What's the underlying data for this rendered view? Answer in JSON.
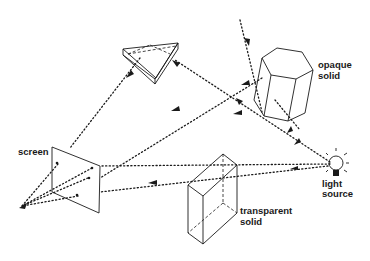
{
  "diagram": {
    "labels": {
      "screen": "screen",
      "opaque_line1": "opaque",
      "opaque_line2": "solid",
      "transparent_line1": "transparent",
      "transparent_line2": "solid",
      "light_line1": "light",
      "light_line2": "source"
    },
    "objects": [
      {
        "id": "light-source",
        "shape": "light bulb with rays"
      },
      {
        "id": "opaque-solid",
        "shape": "hexagonal prism"
      },
      {
        "id": "transparent-solid",
        "shape": "rectangular box (wireframe)"
      },
      {
        "id": "prism",
        "shape": "triangular prism"
      },
      {
        "id": "screen",
        "shape": "tilted plane with dots"
      },
      {
        "id": "eye-point",
        "shape": "viewer point (arrowhead)"
      }
    ],
    "colors": {
      "ink": "#1a1a1a",
      "background": "#ffffff"
    }
  }
}
